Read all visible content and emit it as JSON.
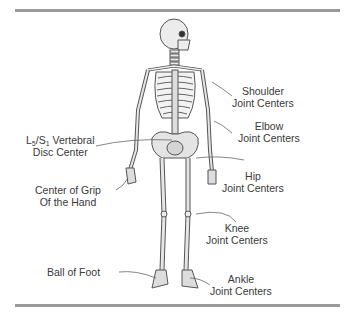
{
  "figure": {
    "title": "",
    "labels": {
      "shoulder": {
        "line1": "Shoulder",
        "line2": "Joint Centers"
      },
      "elbow": {
        "line1": "Elbow",
        "line2": "Joint Centers"
      },
      "vertebral": {
        "prefix": "L",
        "sub1": "5",
        "slash": "/S",
        "sub2": "1",
        "suffix": " Vertebral",
        "line2": "Disc Center"
      },
      "hip": {
        "line1": "Hip",
        "line2": "Joint Centers"
      },
      "grip": {
        "line1": "Center of Grip",
        "line2": "Of the Hand"
      },
      "knee": {
        "line1": "Knee",
        "line2": "Joint Centers"
      },
      "ball": {
        "line1": "Ball of Foot"
      },
      "ankle": {
        "line1": "Ankle",
        "line2": "Joint Centers"
      }
    },
    "colors": {
      "rule": "#9a9a9a",
      "bone": "#e8e8e8",
      "outline": "#555555",
      "leader": "#666666"
    }
  }
}
